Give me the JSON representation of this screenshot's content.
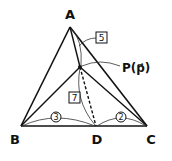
{
  "diagram": {
    "vertices": {
      "A": {
        "label": "A",
        "x": 70,
        "y": 27
      },
      "B": {
        "label": "B",
        "x": 21,
        "y": 126
      },
      "C": {
        "label": "C",
        "x": 147,
        "y": 126
      },
      "D": {
        "label": "D",
        "x": 96,
        "y": 126
      },
      "P": {
        "label": "P(p⃗)",
        "x": 80,
        "y": 67
      }
    },
    "ratios": {
      "AP": "5",
      "PD": "7",
      "BD": "3",
      "DC": "2"
    },
    "colors": {
      "stroke": "#111111",
      "background": "#ffffff"
    }
  }
}
